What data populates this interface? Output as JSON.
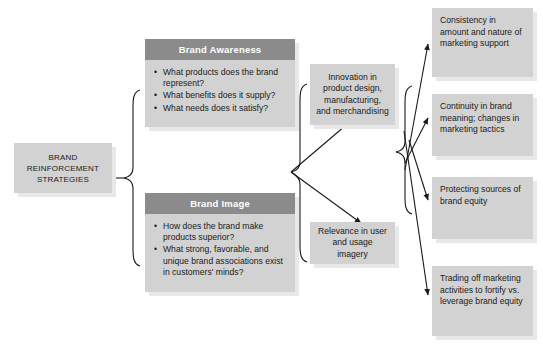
{
  "diagram": {
    "title": "Brand Reinforcement Strategies",
    "colors": {
      "panel_header": "#8b8b8b",
      "box_fill": "#d2d2d2",
      "box_shadow": "#e8e8e8",
      "line": "#1a1a1a",
      "header_text": "#ffffff",
      "body_text": "#1a1a1a",
      "background": "#ffffff"
    },
    "root": {
      "line1": "BRAND",
      "line2": "REINFORCEMENT",
      "line3": "STRATEGIES"
    },
    "panels": [
      {
        "header": "Brand Awareness",
        "bullets": [
          "What products does the brand represent?",
          "What benefits does it supply?",
          "What needs does it satisfy?"
        ]
      },
      {
        "header": "Brand Image",
        "bullets": [
          "How does the brand make products superior?",
          "What strong, favorable, and unique brand associations exist in customers' minds?"
        ]
      }
    ],
    "middle_boxes": [
      {
        "text": "Innovation in product design, manufacturing, and merchandising"
      },
      {
        "text": "Relevance in user and usage imagery"
      }
    ],
    "outcome_boxes": [
      {
        "text": "Consistency in amount and nature of marketing support"
      },
      {
        "text": "Continuity in brand meaning; changes in marketing tactics"
      },
      {
        "text": "Protecting sources of brand equity"
      },
      {
        "text": "Trading off marketing activities to fortify vs. leverage brand equity"
      }
    ]
  }
}
